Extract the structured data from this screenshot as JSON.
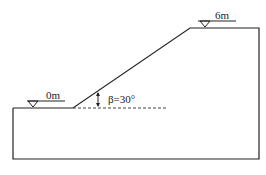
{
  "diagram": {
    "labels": {
      "left_level": "0m",
      "top_level": "6m",
      "angle": "β=30°"
    },
    "geometry": {
      "slope_angle_deg": 30,
      "toe_elevation": "0m",
      "crest_elevation": "6m"
    },
    "colors": {
      "line": "#222222",
      "background": "#ffffff"
    }
  }
}
